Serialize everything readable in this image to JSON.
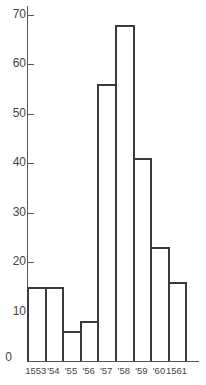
{
  "chart_data": {
    "type": "bar",
    "title": "",
    "xlabel": "",
    "ylabel": "",
    "categories": [
      "1553",
      "'54",
      "'55",
      "'56",
      "'57",
      "'58",
      "'59",
      "'60",
      "1561"
    ],
    "values": [
      15,
      15,
      6,
      8,
      56,
      68,
      41,
      23,
      16
    ],
    "ylim": [
      0,
      70
    ],
    "yticks": [
      0,
      10,
      20,
      30,
      40,
      50,
      60,
      70
    ],
    "grid": false,
    "legend": null,
    "bar_style": "outlined histogram, adjacent bars"
  },
  "colors": {
    "bar_outline": "#3a3a3a",
    "bar_fill": "#ffffff",
    "axis": "#555555",
    "text": "#444444"
  }
}
